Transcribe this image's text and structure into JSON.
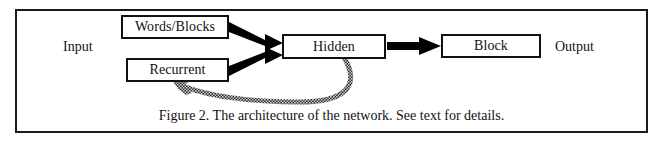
{
  "figure": {
    "caption": "Figure 2.  The architecture of the network.  See text for details.",
    "frame_color": "#1a1a1a",
    "background": "#ffffff"
  },
  "labels": {
    "input": "Input",
    "output": "Output"
  },
  "nodes": [
    {
      "id": "words-blocks",
      "label": "Words/Blocks"
    },
    {
      "id": "recurrent",
      "label": "Recurrent"
    },
    {
      "id": "hidden",
      "label": "Hidden"
    },
    {
      "id": "block",
      "label": "Block"
    }
  ],
  "node_labels": {
    "words_blocks": "Words/Blocks",
    "recurrent": "Recurrent",
    "hidden": "Hidden",
    "block": "Block"
  },
  "edges": [
    {
      "id": "words-to-hidden",
      "from": "words-blocks",
      "to": "hidden",
      "style": "thick-solid-arrow",
      "color": "#000000"
    },
    {
      "id": "recurrent-to-hidden",
      "from": "recurrent",
      "to": "hidden",
      "style": "thick-solid-arrow",
      "color": "#000000"
    },
    {
      "id": "hidden-to-block",
      "from": "hidden",
      "to": "block",
      "style": "thick-solid-arrow",
      "color": "#000000"
    },
    {
      "id": "hidden-to-recurrent-feedback",
      "from": "hidden",
      "to": "recurrent",
      "style": "curved-hatched-arrow",
      "color": "#555555"
    }
  ],
  "colors": {
    "line": "#000000",
    "feedback": "#555555",
    "text": "#111111"
  }
}
